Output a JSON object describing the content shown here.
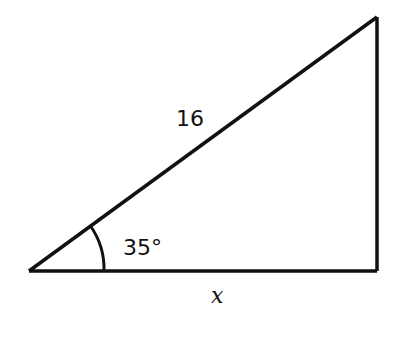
{
  "diagram": {
    "type": "right-triangle",
    "hypotenuse_label": "16",
    "angle_label": "35°",
    "base_label": "x",
    "stroke_color": "#111111",
    "vertices": {
      "left": [
        29,
        271
      ],
      "top_right": [
        377,
        17
      ],
      "bottom_right": [
        377,
        271
      ]
    },
    "angle_arc_radius": 75
  }
}
